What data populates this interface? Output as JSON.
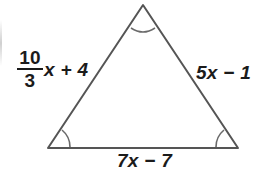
{
  "figure": {
    "type": "geometry-diagram",
    "shape": "triangle",
    "background_color": "#ffffff",
    "stroke_color": "#555555",
    "text_color": "#1b1b1b",
    "width": 270,
    "height": 175,
    "vertices": {
      "apex": {
        "x": 143,
        "y": 5
      },
      "bottom_left": {
        "x": 48,
        "y": 148
      },
      "bottom_right": {
        "x": 238,
        "y": 148
      }
    },
    "angle_marks": [
      {
        "name": "apex-angle-arc",
        "vertex": "apex",
        "arcs": 1
      },
      {
        "name": "bottom-left-angle-arc",
        "vertex": "bottom_left",
        "arcs": 1
      },
      {
        "name": "bottom-right-angle-arc",
        "vertex": "bottom_right",
        "arcs": 1
      }
    ],
    "labels": {
      "left_side": {
        "text": "10/3 x + 4",
        "fraction": {
          "numerator": "10",
          "denominator": "3"
        },
        "tail_variable": "x",
        "tail_operator": "+",
        "tail_constant": "4",
        "tail_text": "x + 4"
      },
      "right_side": {
        "text": "5x − 1",
        "coefficient": "5",
        "variable": "x",
        "operator": "−",
        "constant": "1"
      },
      "bottom_side": {
        "text": "7x − 7",
        "coefficient": "7",
        "variable": "x",
        "operator": "−",
        "constant": "7"
      }
    }
  }
}
